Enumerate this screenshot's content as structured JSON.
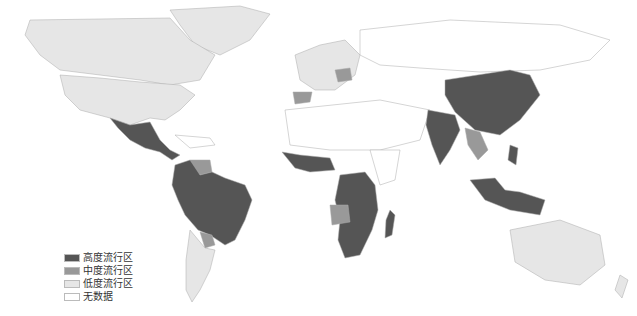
{
  "map": {
    "type": "world choropleth",
    "colors": {
      "high": "#555555",
      "medium": "#999999",
      "low": "#e6e6e6",
      "none": "#ffffff",
      "border": "#aaaaaa"
    }
  },
  "legend": {
    "items": [
      {
        "label": "高度流行区",
        "color": "#555555"
      },
      {
        "label": "中度流行区",
        "color": "#999999"
      },
      {
        "label": "低度流行区",
        "color": "#e6e6e6"
      },
      {
        "label": "无数据",
        "color": "#ffffff"
      }
    ]
  },
  "regions": {
    "high": [
      "Mexico",
      "Central America",
      "Colombia",
      "Brazil",
      "Peru",
      "Bolivia",
      "West Africa",
      "Central Africa",
      "Southern Africa",
      "Madagascar",
      "India",
      "China",
      "Southeast Asia",
      "Indonesia",
      "Philippines"
    ],
    "medium": [
      "Venezuela",
      "Spain",
      "Poland",
      "Angola",
      "Paraguay",
      "Myanmar",
      "Thailand",
      "Laos",
      "Nepal"
    ],
    "low": [
      "Canada",
      "United States",
      "Greenland",
      "Western Europe",
      "Argentina",
      "Chile",
      "Australia",
      "Russia"
    ]
  }
}
